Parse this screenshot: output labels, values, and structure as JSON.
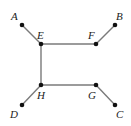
{
  "diagram": {
    "type": "graph",
    "colors": {
      "edge": "#7a7a7a",
      "node": "#111111",
      "label": "#222222"
    },
    "nodes": [
      {
        "id": "A",
        "label": "A",
        "x": 22,
        "y": 25,
        "lx": 11,
        "ly": 20
      },
      {
        "id": "B",
        "label": "B",
        "x": 115,
        "y": 25,
        "lx": 116,
        "ly": 20
      },
      {
        "id": "C",
        "label": "C",
        "x": 115,
        "y": 105,
        "lx": 116,
        "ly": 118
      },
      {
        "id": "D",
        "label": "D",
        "x": 22,
        "y": 105,
        "lx": 10,
        "ly": 118
      },
      {
        "id": "E",
        "label": "E",
        "x": 41,
        "y": 44,
        "lx": 37,
        "ly": 39
      },
      {
        "id": "F",
        "label": "F",
        "x": 96,
        "y": 44,
        "lx": 88,
        "ly": 39
      },
      {
        "id": "G",
        "label": "G",
        "x": 96,
        "y": 85,
        "lx": 88,
        "ly": 99
      },
      {
        "id": "H",
        "label": "H",
        "x": 41,
        "y": 85,
        "lx": 37,
        "ly": 99
      }
    ],
    "edges": [
      [
        "A",
        "E"
      ],
      [
        "E",
        "F"
      ],
      [
        "F",
        "B"
      ],
      [
        "E",
        "H"
      ],
      [
        "H",
        "G"
      ],
      [
        "H",
        "D"
      ],
      [
        "G",
        "C"
      ]
    ]
  }
}
